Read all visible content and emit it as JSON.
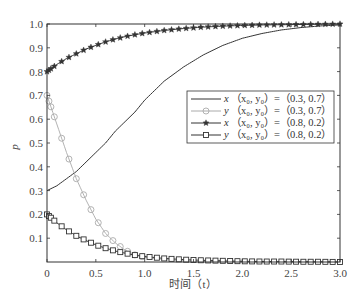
{
  "chart_data": {
    "type": "line",
    "title": "",
    "xlabel": "时间（t）",
    "ylabel": "p",
    "xlim": [
      0,
      3.0
    ],
    "ylim": [
      0,
      1.0
    ],
    "grid": false,
    "legend_position": "center-right",
    "x_ticks": [
      "0",
      "0.5",
      "1.0",
      "1.5",
      "2.0",
      "2.5",
      "3.0"
    ],
    "y_ticks": [
      "0.1",
      "0.2",
      "0.3",
      "0.4",
      "0.5",
      "0.6",
      "0.7",
      "0.8",
      "0.9",
      "1.0"
    ],
    "x": [
      0,
      0.1,
      0.2,
      0.3,
      0.4,
      0.5,
      0.6,
      0.7,
      0.8,
      0.9,
      1.0,
      1.2,
      1.4,
      1.6,
      1.8,
      2.0,
      2.2,
      2.4,
      2.6,
      2.8,
      3.0
    ],
    "series": [
      {
        "name": "x（x0, y0）=（0.3, 0.7）",
        "marker": "none",
        "color": "#333333",
        "values": [
          0.3,
          0.32,
          0.35,
          0.38,
          0.42,
          0.46,
          0.5,
          0.55,
          0.59,
          0.63,
          0.68,
          0.76,
          0.82,
          0.87,
          0.91,
          0.94,
          0.96,
          0.975,
          0.985,
          0.992,
          0.996
        ]
      },
      {
        "name": "y（x0, y0）=（0.3, 0.7）",
        "marker": "circle",
        "color": "#aaaaaa",
        "values": [
          0.7,
          0.58,
          0.46,
          0.35,
          0.26,
          0.18,
          0.12,
          0.08,
          0.05,
          0.03,
          0.02,
          0.01,
          0.005,
          0.003,
          0.002,
          0.001,
          0.001,
          0.0,
          0.0,
          0.0,
          0.0
        ]
      },
      {
        "name": "x（x0, y0）=（0.8, 0.2）",
        "marker": "star",
        "color": "#333333",
        "values": [
          0.8,
          0.83,
          0.855,
          0.875,
          0.895,
          0.91,
          0.925,
          0.937,
          0.947,
          0.955,
          0.962,
          0.973,
          0.981,
          0.987,
          0.991,
          0.994,
          0.996,
          0.997,
          0.998,
          0.999,
          1.0
        ]
      },
      {
        "name": "y（x0, y0）=（0.8, 0.2）",
        "marker": "square",
        "color": "#333333",
        "values": [
          0.2,
          0.165,
          0.135,
          0.11,
          0.09,
          0.072,
          0.058,
          0.046,
          0.037,
          0.029,
          0.023,
          0.015,
          0.01,
          0.007,
          0.005,
          0.003,
          0.002,
          0.002,
          0.001,
          0.001,
          0.0
        ]
      }
    ]
  },
  "legend": {
    "items": [
      {
        "var": "x",
        "label": "（x₀, y₀）=（0.3, 0.7）"
      },
      {
        "var": "y",
        "label": "（x₀, y₀）=（0.3, 0.7）"
      },
      {
        "var": "x",
        "label": "（x₀, y₀）=（0.8, 0.2）"
      },
      {
        "var": "y",
        "label": "（x₀, y₀）=（0.8, 0.2）"
      }
    ]
  },
  "axes": {
    "xlabel": "时间（t）",
    "ylabel": "p"
  }
}
